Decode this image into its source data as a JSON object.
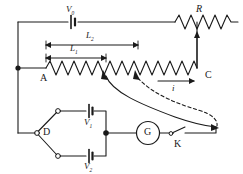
{
  "figure": {
    "type": "circuit-diagram",
    "stroke_color": "#1a1a1a",
    "background_color": "#ffffff"
  },
  "labels": {
    "driver_battery": "V",
    "driver_battery_sub": "0",
    "rheostat": "R",
    "length_long": "L",
    "length_long_sub": "2",
    "length_short": "L",
    "length_short_sub": "1",
    "terminal_a": "A",
    "terminal_c": "C",
    "current": "i",
    "switch_d": "D",
    "cell_one": "V",
    "cell_one_sub": "1",
    "cell_two": "V",
    "cell_two_sub": "2",
    "galvanometer": "G",
    "key": "K"
  },
  "components": [
    {
      "name": "driver-cell",
      "symbol": "battery",
      "label": "V0"
    },
    {
      "name": "rheostat",
      "symbol": "resistor-zigzag",
      "label": "R"
    },
    {
      "name": "slide-wire",
      "symbol": "resistor-zigzag",
      "label": "A-C"
    },
    {
      "name": "two-way-switch",
      "symbol": "spdt-switch",
      "label": "D"
    },
    {
      "name": "cell-v1",
      "symbol": "battery",
      "label": "V1"
    },
    {
      "name": "cell-v2",
      "symbol": "battery",
      "label": "V2"
    },
    {
      "name": "galvanometer",
      "symbol": "circle-meter",
      "label": "G"
    },
    {
      "name": "key-switch",
      "symbol": "knife-switch",
      "label": "K"
    }
  ],
  "dimension_arrows": [
    {
      "name": "L2",
      "from": "A",
      "to": "tap-2",
      "label": "L2"
    },
    {
      "name": "L1",
      "from": "A",
      "to": "tap-1",
      "label": "L1"
    },
    {
      "name": "i",
      "direction": "right",
      "label": "i"
    }
  ]
}
